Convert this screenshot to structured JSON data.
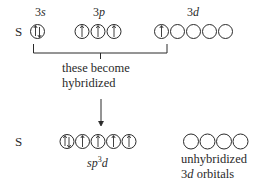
{
  "top_row": {
    "element_symbol": "S",
    "subshells": [
      {
        "label_num": "3",
        "label_letter": "s",
        "orbitals": [
          "up-down"
        ]
      },
      {
        "label_num": "3",
        "label_letter": "p",
        "orbitals": [
          "up",
          "up",
          "up"
        ]
      },
      {
        "label_num": "3",
        "label_letter": "d",
        "orbitals": [
          "up",
          "empty",
          "empty",
          "empty",
          "empty"
        ]
      }
    ]
  },
  "bracket_caption": {
    "line1": "these become",
    "line2": "hybridized"
  },
  "bottom_row": {
    "element_symbol": "S",
    "hybrid": {
      "label_prefix": "sp",
      "label_sup": "3",
      "label_suffix": "d",
      "orbitals": [
        "up-down",
        "up",
        "up",
        "up",
        "up"
      ]
    },
    "unhybridized": {
      "orbitals": [
        "empty",
        "empty",
        "empty",
        "empty"
      ],
      "caption_line1": "unhybridized",
      "caption_line2_num": "3",
      "caption_line2_letter": "d",
      "caption_line2_rest": " orbitals"
    }
  },
  "colors": {
    "ink": "#2a2a2a",
    "background": "#ffffff"
  }
}
